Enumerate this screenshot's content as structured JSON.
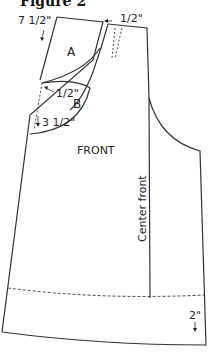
{
  "figure": {
    "title": "Figure 2",
    "piece_label": "FRONT",
    "center_front_label": "Center front",
    "piece_a_label": "A",
    "piece_b_label": "B",
    "measurements": {
      "shoulder_drop": "7 1/2\"",
      "neck_shift": "1/2\"",
      "b_shift": "1/2\"",
      "b_drop": "3 1/2\"",
      "hem_allowance": "2\""
    },
    "colors": {
      "line": "#333333",
      "background": "#ffffff"
    }
  }
}
